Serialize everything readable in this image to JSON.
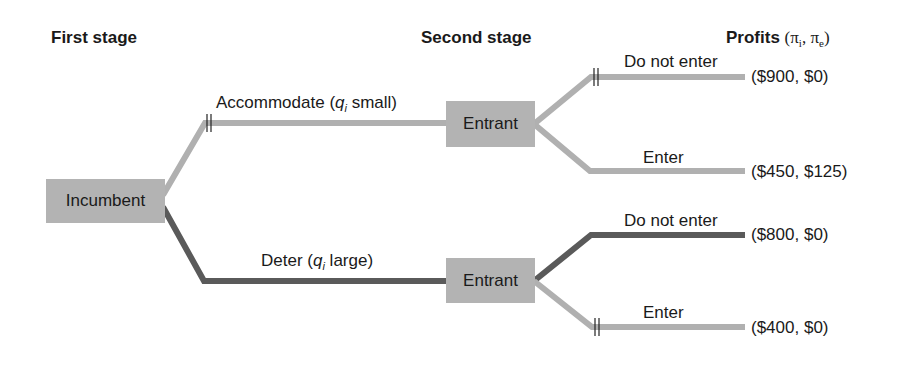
{
  "headers": {
    "first_stage": "First stage",
    "second_stage": "Second stage",
    "profits": "Profits",
    "profits_notation_open": "(π",
    "profits_sub_i": "i",
    "profits_mid": ", π",
    "profits_sub_e": "e",
    "profits_close": ")"
  },
  "nodes": {
    "incumbent": "Incumbent",
    "entrant_top": "Entrant",
    "entrant_bottom": "Entrant"
  },
  "branches": {
    "accommodate": {
      "pre": "Accommodate (",
      "var": "q",
      "sub": "i",
      "post": " small)"
    },
    "deter": {
      "pre": "Deter (",
      "var": "q",
      "sub": "i",
      "post": " large)"
    },
    "top_do_not_enter": "Do not enter",
    "top_enter": "Enter",
    "bottom_do_not_enter": "Do not enter",
    "bottom_enter": "Enter"
  },
  "payoffs": {
    "accommodate_do_not_enter": "($900, $0)",
    "accommodate_enter": "($450, $125)",
    "deter_do_not_enter": "($800, $0)",
    "deter_enter": "($400, $0)"
  },
  "colors": {
    "light_branch": "#b0b0b0",
    "dark_branch": "#5a5a5a",
    "node_fill": "#b3b3b3"
  }
}
